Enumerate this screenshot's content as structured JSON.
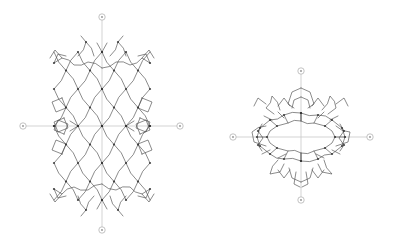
{
  "window": {
    "width": 394,
    "height": 241,
    "background": "#ffffff"
  },
  "colors": {
    "bond": "#4a4a4a",
    "knot": "#303030",
    "axis": "#c8c8c8",
    "marker_stroke": "#b4b4b4",
    "marker_fill": "#ffffff",
    "marker_glyph": "#8f8f8f"
  },
  "style": {
    "bond_width": 0.75,
    "bond_opacity": 0.85,
    "axis_width": 0.8,
    "marker_radius": 3.2,
    "knot_radius": 1.1,
    "zigzag_amp": 1.6
  },
  "views": [
    {
      "name": "structure-view-left",
      "center": [
        102,
        126
      ],
      "axes": [
        {
          "name": "vertical-axis-line",
          "x1": 102,
          "y1": 17,
          "x2": 102,
          "y2": 230
        },
        {
          "name": "horizontal-axis-line",
          "x1": 23,
          "y1": 126,
          "x2": 180,
          "y2": 126
        }
      ],
      "markers": [
        [
          102,
          17
        ],
        [
          102,
          230
        ],
        [
          23,
          126
        ],
        [
          180,
          126
        ]
      ],
      "polylines": [
        {
          "sym": "xy",
          "closed": false,
          "pts": [
            [
              0,
              0
            ],
            [
              12,
              -18.5
            ],
            [
              0,
              -37
            ],
            [
              12,
              -55.5
            ],
            [
              0,
              -74
            ]
          ]
        },
        {
          "sym": "xy",
          "closed": false,
          "pts": [
            [
              24,
              0
            ],
            [
              12,
              -18.5
            ],
            [
              24,
              -37
            ],
            [
              12,
              -55.5
            ],
            [
              24,
              -74
            ]
          ]
        },
        {
          "sym": "xy",
          "closed": false,
          "pts": [
            [
              24,
              0
            ],
            [
              36,
              -18.5
            ],
            [
              24,
              -37
            ],
            [
              36,
              -55.5
            ],
            [
              24,
              -74
            ]
          ]
        },
        {
          "sym": "xy",
          "closed": false,
          "pts": [
            [
              48,
              0
            ],
            [
              36,
              -18.5
            ],
            [
              48,
              -37
            ],
            [
              36,
              -55.5
            ],
            [
              48,
              -74
            ]
          ]
        },
        {
          "sym": "xy",
          "closed": false,
          "pts": [
            [
              8,
              -70
            ],
            [
              16,
              -84
            ],
            [
              24,
              -70
            ]
          ]
        },
        {
          "sym": "xy",
          "closed": false,
          "pts": [
            [
              16,
              -84
            ],
            [
              21,
              -90
            ]
          ]
        },
        {
          "sym": "xy",
          "closed": false,
          "pts": [
            [
              0,
              -58
            ],
            [
              14,
              -64
            ],
            [
              28,
              -61
            ],
            [
              40,
              -68
            ],
            [
              48,
              -63
            ]
          ]
        },
        {
          "sym": "xy",
          "closed": false,
          "pts": [
            [
              48,
              -63
            ],
            [
              44,
              -72
            ],
            [
              36,
              -70
            ]
          ]
        },
        {
          "sym": "xy",
          "closed": false,
          "pts": [
            [
              40,
              -68
            ],
            [
              47,
              -76
            ],
            [
              52,
              -68
            ]
          ]
        },
        {
          "sym": "xy",
          "closed": true,
          "pts": [
            [
              40,
              -28
            ],
            [
              50,
              -24
            ],
            [
              46,
              -14
            ],
            [
              36,
              -18
            ]
          ]
        },
        {
          "sym": "xy",
          "closed": true,
          "pts": [
            [
              38,
              -8
            ],
            [
              48,
              -4
            ],
            [
              44,
              6
            ],
            [
              34,
              2
            ]
          ]
        },
        {
          "sym": "xy",
          "closed": false,
          "pts": [
            [
              24,
              0
            ],
            [
              32,
              -5
            ]
          ]
        },
        {
          "sym": "xy",
          "closed": false,
          "pts": [
            [
              0,
              -74
            ],
            [
              5,
              -83
            ]
          ]
        }
      ],
      "knots": {
        "sym": "xy",
        "pts": [
          [
            0,
            0
          ],
          [
            24,
            0
          ],
          [
            48,
            0
          ],
          [
            12,
            -18.5
          ],
          [
            36,
            -18.5
          ],
          [
            0,
            -37
          ],
          [
            24,
            -37
          ],
          [
            48,
            -37
          ],
          [
            12,
            -55.5
          ],
          [
            36,
            -55.5
          ],
          [
            0,
            -74
          ],
          [
            24,
            -74
          ],
          [
            48,
            -63
          ],
          [
            16,
            -84
          ]
        ]
      }
    },
    {
      "name": "structure-view-right",
      "center": [
        301,
        137
      ],
      "axes": [
        {
          "name": "vertical-axis-line",
          "x1": 301,
          "y1": 71,
          "x2": 301,
          "y2": 200
        },
        {
          "name": "horizontal-axis-line",
          "x1": 233,
          "y1": 137,
          "x2": 370,
          "y2": 137
        }
      ],
      "markers": [
        [
          301,
          71
        ],
        [
          301,
          200
        ],
        [
          233,
          137
        ],
        [
          370,
          137
        ]
      ],
      "polylines": [
        {
          "sym": "none",
          "closed": true,
          "pts": [
            [
              44,
              0
            ],
            [
              41,
              -9
            ],
            [
              31,
              -17
            ],
            [
              17,
              -22
            ],
            [
              0,
              -24
            ],
            [
              -17,
              -22
            ],
            [
              -31,
              -17
            ],
            [
              -41,
              -9
            ],
            [
              -44,
              0
            ],
            [
              -41,
              9
            ],
            [
              -31,
              17
            ],
            [
              -17,
              22
            ],
            [
              0,
              24
            ],
            [
              17,
              22
            ],
            [
              31,
              17
            ],
            [
              41,
              9
            ]
          ]
        },
        {
          "sym": "none",
          "closed": true,
          "pts": [
            [
              34,
              0
            ],
            [
              31,
              -6
            ],
            [
              24,
              -11
            ],
            [
              13,
              -14
            ],
            [
              0,
              -16
            ],
            [
              -13,
              -14
            ],
            [
              -24,
              -11
            ],
            [
              -31,
              -6
            ],
            [
              -34,
              0
            ],
            [
              -31,
              6
            ],
            [
              -24,
              11
            ],
            [
              -13,
              14
            ],
            [
              0,
              16
            ],
            [
              13,
              14
            ],
            [
              24,
              11
            ],
            [
              31,
              6
            ]
          ]
        },
        {
          "sym": "x",
          "closed": false,
          "pts": [
            [
              44,
              0
            ],
            [
              34,
              0
            ]
          ]
        },
        {
          "sym": "x",
          "closed": false,
          "pts": [
            [
              31,
              -17
            ],
            [
              24,
              -11
            ]
          ]
        },
        {
          "sym": "x",
          "closed": false,
          "pts": [
            [
              17,
              -22
            ],
            [
              13,
              -14
            ]
          ]
        },
        {
          "sym": "x",
          "closed": false,
          "pts": [
            [
              31,
              17
            ],
            [
              24,
              11
            ]
          ]
        },
        {
          "sym": "x",
          "closed": false,
          "pts": [
            [
              17,
              22
            ],
            [
              13,
              14
            ]
          ]
        },
        {
          "sym": "x",
          "closed": false,
          "pts": [
            [
              0,
              -24
            ],
            [
              0,
              -16
            ]
          ]
        },
        {
          "sym": "x",
          "closed": false,
          "pts": [
            [
              0,
              24
            ],
            [
              0,
              16
            ]
          ]
        },
        {
          "sym": "x",
          "closed": false,
          "pts": [
            [
              39,
              -13
            ],
            [
              43,
              -6
            ],
            [
              38,
              1
            ],
            [
              43,
              8
            ],
            [
              39,
              14
            ]
          ]
        },
        {
          "sym": "x",
          "closed": false,
          "pts": [
            [
              0,
              -49
            ],
            [
              9,
              -45
            ],
            [
              13,
              -33
            ],
            [
              7,
              -29
            ]
          ]
        },
        {
          "sym": "x",
          "closed": false,
          "pts": [
            [
              0,
              -40
            ],
            [
              7,
              -37
            ],
            [
              9,
              -29
            ]
          ]
        },
        {
          "sym": "x",
          "closed": false,
          "pts": [
            [
              21,
              -27
            ],
            [
              29,
              -41
            ],
            [
              35,
              -29
            ],
            [
              27,
              -23
            ]
          ]
        },
        {
          "sym": "x",
          "closed": false,
          "pts": [
            [
              35,
              -33
            ],
            [
              43,
              -39
            ],
            [
              47,
              -31
            ]
          ]
        },
        {
          "sym": "x",
          "closed": false,
          "pts": [
            [
              11,
              -31
            ],
            [
              17,
              -39
            ],
            [
              23,
              -31
            ]
          ]
        },
        {
          "sym": "x",
          "closed": false,
          "pts": [
            [
              35,
              -11
            ],
            [
              49,
              -5
            ],
            [
              47,
              5
            ],
            [
              35,
              9
            ]
          ]
        },
        {
          "sym": "x",
          "closed": false,
          "pts": [
            [
              23,
              23
            ],
            [
              31,
              37
            ],
            [
              21,
              35
            ],
            [
              17,
              27
            ]
          ]
        },
        {
          "sym": "x",
          "closed": false,
          "pts": [
            [
              0,
              45
            ],
            [
              9,
              41
            ],
            [
              12,
              31
            ]
          ]
        },
        {
          "sym": "x",
          "closed": false,
          "pts": [
            [
              -5,
              35
            ],
            [
              -7,
              47
            ],
            [
              -1,
              50
            ]
          ]
        },
        {
          "sym": "x",
          "closed": false,
          "pts": [
            [
              11,
              33
            ],
            [
              17,
              41
            ],
            [
              23,
              33
            ]
          ]
        },
        {
          "sym": "x",
          "closed": false,
          "pts": [
            [
              17,
              -19
            ],
            [
              23,
              -25
            ]
          ]
        },
        {
          "sym": "x",
          "closed": false,
          "pts": [
            [
              29,
              -17
            ],
            [
              37,
              -21
            ]
          ]
        },
        {
          "sym": "x",
          "closed": false,
          "pts": [
            [
              15,
              17
            ],
            [
              23,
              21
            ]
          ]
        },
        {
          "sym": "x",
          "closed": false,
          "pts": [
            [
              31,
              13
            ],
            [
              39,
              17
            ]
          ]
        }
      ],
      "knots": {
        "sym": "x",
        "pts": [
          [
            44,
            0
          ],
          [
            41,
            -9
          ],
          [
            31,
            -17
          ],
          [
            17,
            -22
          ],
          [
            0,
            -24
          ],
          [
            41,
            9
          ],
          [
            31,
            17
          ],
          [
            17,
            22
          ],
          [
            0,
            24
          ],
          [
            34,
            0
          ],
          [
            24,
            -11
          ],
          [
            24,
            11
          ],
          [
            43,
            -6
          ],
          [
            43,
            8
          ]
        ]
      }
    }
  ]
}
